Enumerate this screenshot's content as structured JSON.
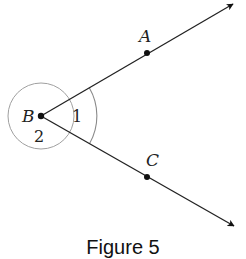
{
  "figure": {
    "caption": "Figure 5",
    "vertex": {
      "label": "B",
      "x": 41,
      "y": 116
    },
    "points": [
      {
        "label": "A",
        "x": 147,
        "y": 53
      },
      {
        "label": "C",
        "x": 147,
        "y": 177
      }
    ],
    "rays": [
      {
        "name": "ray-BA",
        "from": [
          41,
          116
        ],
        "to": [
          233,
          4
        ]
      },
      {
        "name": "ray-BC",
        "from": [
          41,
          116
        ],
        "to": [
          234,
          226
        ]
      }
    ],
    "angles": [
      {
        "label": "1",
        "type": "interior-arc"
      },
      {
        "label": "2",
        "type": "reflex-circle"
      }
    ],
    "colors": {
      "line": "#222222",
      "arc": "#999999",
      "background": "#ffffff"
    }
  }
}
